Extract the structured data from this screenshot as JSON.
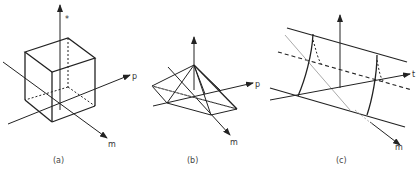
{
  "figure": {
    "panels": [
      {
        "id": "a",
        "caption": "(a)",
        "shape": "cube",
        "axis_labels": {
          "vertical": "*",
          "horizontal": "p",
          "diagonal": "m"
        }
      },
      {
        "id": "b",
        "caption": "(b)",
        "shape": "pyramid",
        "axis_labels": {
          "horizontal": "p",
          "diagonal": "m"
        }
      },
      {
        "id": "c",
        "caption": "(c)",
        "shape": "cylinder",
        "axis_labels": {
          "horizontal": "t",
          "diagonal": "m"
        }
      }
    ],
    "colors": {
      "line": "#222222",
      "light_line": "#999999",
      "background": "#ffffff"
    }
  }
}
